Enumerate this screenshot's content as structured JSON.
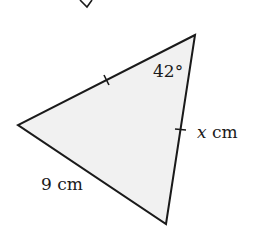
{
  "diagram": {
    "type": "triangle",
    "fill_color": "#f1f1f1",
    "stroke_color": "#1a1a1a",
    "vertices": {
      "top": [
        195,
        35
      ],
      "left": [
        18,
        125
      ],
      "bottom": [
        166,
        224
      ]
    },
    "angle_label": "42°",
    "side_labels": {
      "left_bottom": "9 cm",
      "right_variable": "x",
      "right_unit": " cm"
    },
    "equal_side_ticks": [
      "top-left side",
      "top-bottom side"
    ],
    "partial_mark_top": "V"
  }
}
